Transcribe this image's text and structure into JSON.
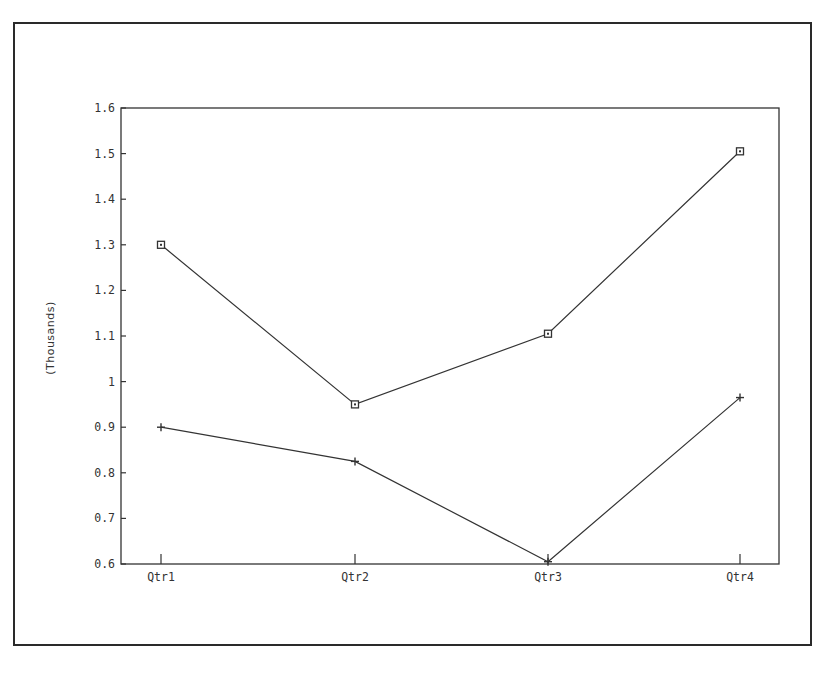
{
  "chart_data": {
    "type": "line",
    "title": "",
    "xlabel": "",
    "ylabel": "(Thousands)",
    "categories": [
      "Qtr1",
      "Qtr2",
      "Qtr3",
      "Qtr4"
    ],
    "series": [
      {
        "name": "Series 1",
        "marker": "square",
        "values": [
          1.3,
          0.95,
          1.105,
          1.505
        ]
      },
      {
        "name": "Series 2",
        "marker": "plus",
        "values": [
          0.9,
          0.825,
          0.605,
          0.965
        ]
      }
    ],
    "ylim": [
      0.6,
      1.6
    ],
    "yticks": [
      "0.6",
      "0.7",
      "0.8",
      "0.9",
      "1",
      "1.1",
      "1.2",
      "1.3",
      "1.4",
      "1.5",
      "1.6"
    ],
    "grid": false,
    "legend": "none",
    "colors": {
      "line": "#333333",
      "axis": "#333333",
      "frame": "#2a2a2a"
    }
  }
}
